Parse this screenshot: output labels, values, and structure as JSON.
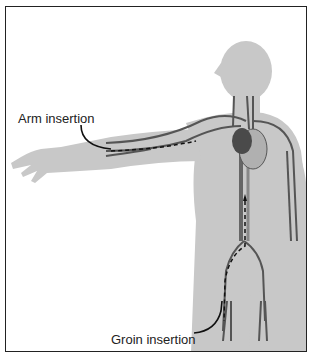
{
  "diagram": {
    "title": "",
    "labels": {
      "arm_insertion": "Arm insertion",
      "groin_insertion": "Groin insertion"
    },
    "colors": {
      "body": "#c8c8c8",
      "vessel": "#555555",
      "vessel_light": "#8a8a8a",
      "heart_dark": "#4a4a4a",
      "heart_light": "#b0b0b0",
      "leader_line": "#111111",
      "border": "#222222"
    }
  }
}
